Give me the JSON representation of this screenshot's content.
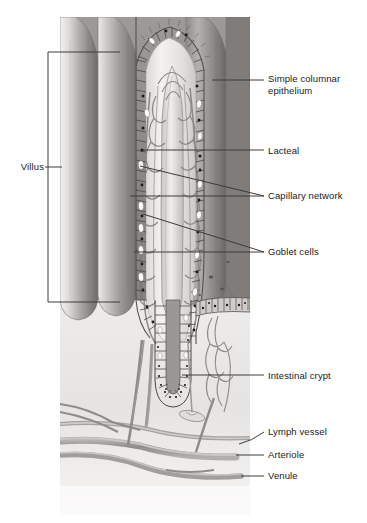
{
  "figure": {
    "kind": "anatomical-illustration",
    "style": "grayscale pencil/airbrush medical illustration"
  },
  "palette": {
    "background": "#ffffff",
    "leader_line": "#3c3c3c",
    "label_text": "#1a1a1a",
    "bracket": "#3c3c3c",
    "tissue_light": "#e8e6e4",
    "tissue_mid": "#b9b6b4",
    "tissue_dark": "#8d8a88",
    "tissue_darkest": "#6a6866",
    "lumen_pale": "#f2f1ef",
    "vessel_gray": "#9a9896",
    "goblet_white": "#fbfbfb",
    "nucleus_black": "#1c1c1c"
  },
  "bracket": {
    "name": "villus-bracket",
    "x": 48,
    "y": 52,
    "width": 72,
    "height": 250
  },
  "labels": [
    {
      "id": "villus",
      "text": "Villus",
      "side": "left",
      "text_x": 6,
      "text_y": 162,
      "leader": [
        [
          45,
          167
        ],
        [
          62,
          167
        ]
      ]
    },
    {
      "id": "simple-columnar-epithelium",
      "text": "Simple columnar\nepithelium",
      "line1": "Simple columnar",
      "line2": "epithelium",
      "side": "right",
      "text_x": 268,
      "text_y": 73,
      "leader": [
        [
          212,
          80
        ],
        [
          264,
          80
        ]
      ]
    },
    {
      "id": "lacteal",
      "text": "Lacteal",
      "side": "right",
      "text_x": 268,
      "text_y": 145,
      "leader": [
        [
          143,
          150
        ],
        [
          264,
          150
        ]
      ]
    },
    {
      "id": "capillary-network",
      "text": "Capillary network",
      "side": "right",
      "text_x": 268,
      "text_y": 190,
      "leaders": [
        [
          [
            140,
            166
          ],
          [
            264,
            196
          ]
        ],
        [
          [
            130,
            196
          ],
          [
            264,
            196
          ]
        ]
      ]
    },
    {
      "id": "goblet-cells",
      "text": "Goblet cells",
      "side": "right",
      "text_x": 268,
      "text_y": 246,
      "leaders": [
        [
          [
            143,
            214
          ],
          [
            264,
            252
          ]
        ],
        [
          [
            134,
            252
          ],
          [
            264,
            252
          ]
        ]
      ]
    },
    {
      "id": "intestinal-crypt",
      "text": "Intestinal crypt",
      "side": "right",
      "text_x": 268,
      "text_y": 370,
      "leader": [
        [
          182,
          375
        ],
        [
          264,
          375
        ]
      ]
    },
    {
      "id": "lymph-vessel",
      "text": "Lymph vessel",
      "side": "right",
      "text_x": 268,
      "text_y": 427,
      "leader": [
        [
          239,
          444
        ],
        [
          264,
          432
        ]
      ]
    },
    {
      "id": "arteriole",
      "text": "Arteriole",
      "side": "right",
      "text_x": 268,
      "text_y": 450,
      "leader": [
        [
          236,
          455
        ],
        [
          264,
          455
        ]
      ]
    },
    {
      "id": "venule",
      "text": "Venule",
      "side": "right",
      "text_x": 268,
      "text_y": 471,
      "leader": [
        [
          241,
          476
        ],
        [
          264,
          476
        ]
      ]
    }
  ],
  "structures": [
    {
      "name": "villus",
      "count": 4,
      "description": "finger-like mucosal projections"
    },
    {
      "name": "lacteal",
      "description": "central lymphatic capillary in villus core"
    },
    {
      "name": "capillary-network",
      "description": "looping blood capillary plexus around lacteal"
    },
    {
      "name": "goblet-cells",
      "description": "pale mucus-secreting cells within epithelium"
    },
    {
      "name": "simple-columnar-epithelium",
      "description": "single layer of tall cells lining villus"
    },
    {
      "name": "intestinal-crypt",
      "description": "crypt of Lieberkuhn, tubular gland at villus base"
    },
    {
      "name": "lymph-vessel",
      "description": "lymphatic drainage vessel at submucosa"
    },
    {
      "name": "arteriole",
      "description": "supplying arteriole at submucosa"
    },
    {
      "name": "venule",
      "description": "draining venule at submucosa"
    }
  ],
  "artwork_bounds": {
    "x": 60,
    "y": 17,
    "width": 190,
    "height": 498
  }
}
